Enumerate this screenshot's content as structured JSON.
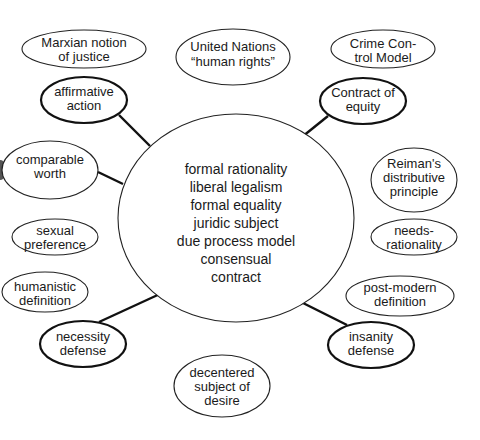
{
  "diagram": {
    "type": "concept-map",
    "center": {
      "lines": [
        "formal rationality",
        "liberal legalism",
        "formal equality",
        "juridic subject",
        "due process model",
        "consensual",
        "contract"
      ]
    },
    "nodes": [
      {
        "id": "marxian",
        "lines": [
          "Marxian notion",
          "of justice"
        ],
        "connected": false
      },
      {
        "id": "united-nations",
        "lines": [
          "United Nations",
          "“human rights”"
        ],
        "connected": false
      },
      {
        "id": "crime-control",
        "lines": [
          "Crime Con-",
          "trol Model"
        ],
        "connected": false
      },
      {
        "id": "affirmative-action",
        "lines": [
          "affirmative",
          "action"
        ],
        "connected": true
      },
      {
        "id": "contract-of-equity",
        "lines": [
          "Contract of",
          "equity"
        ],
        "connected": true
      },
      {
        "id": "comparable-worth",
        "lines": [
          "comparable",
          "worth"
        ],
        "connected": true
      },
      {
        "id": "reiman",
        "lines": [
          "Reiman's",
          "distributive",
          "principle"
        ],
        "connected": false
      },
      {
        "id": "sexual-preference",
        "lines": [
          "sexual",
          "preference"
        ],
        "connected": false
      },
      {
        "id": "needs-rationality",
        "lines": [
          "needs-",
          "rationality"
        ],
        "connected": false
      },
      {
        "id": "humanistic-definition",
        "lines": [
          "humanistic",
          "definition"
        ],
        "connected": false
      },
      {
        "id": "post-modern-definition",
        "lines": [
          "post-modern",
          "definition"
        ],
        "connected": false
      },
      {
        "id": "necessity-defense",
        "lines": [
          "necessity",
          "defense"
        ],
        "connected": true
      },
      {
        "id": "insanity-defense",
        "lines": [
          "insanity",
          "defense"
        ],
        "connected": true
      },
      {
        "id": "decentered-subject",
        "lines": [
          "decentered",
          "subject of",
          "desire"
        ],
        "connected": false
      }
    ]
  }
}
